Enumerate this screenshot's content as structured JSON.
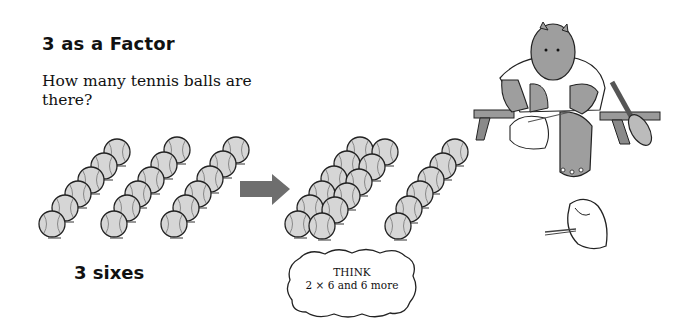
{
  "lesson": {
    "title": "3 as a Factor",
    "question": "How many tennis balls are there?",
    "caption": "3 sixes",
    "think_bubble": {
      "line1": "THINK",
      "line2": "2 × 6 and 6 more"
    }
  },
  "illustration": {
    "left_group": {
      "rows": 3,
      "balls_per_row": 6,
      "label": "3 sixes"
    },
    "arrow": {
      "direction": "right",
      "color": "#6e6e6e"
    },
    "right_group": {
      "double_row_balls": 12,
      "single_row_balls": 6
    },
    "character": "hippo-tying-shoe-on-bench",
    "ball_color": "#d6d6d6",
    "outline_color": "#222222"
  }
}
